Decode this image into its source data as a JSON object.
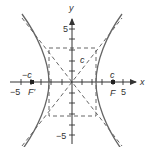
{
  "diagram": {
    "colors": {
      "curve": "#666666",
      "axis": "#333333",
      "dashed": "#555555",
      "text": "#333333"
    },
    "axes": {
      "x_label": "x",
      "y_label": "y",
      "x_tick_labels": {
        "neg5": "−5",
        "pos5": "5"
      },
      "y_tick_labels": {
        "pos5": "5",
        "neg5": "−5"
      }
    },
    "labels": {
      "neg_c": "−c",
      "pos_c": "c",
      "c_hyp": "c",
      "focus_left": "F′",
      "focus_right": "F"
    }
  }
}
